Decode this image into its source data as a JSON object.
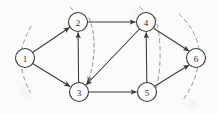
{
  "figure": {
    "background_color": "#fcfbf9",
    "node_stroke_color": "#3a3a3a",
    "edge_color": "#3a3a3a",
    "cut_color": "#9a9a96",
    "width": 218,
    "height": 114
  },
  "nodes": [
    {
      "id": "1",
      "label": "1",
      "cx": 25,
      "cy": 58,
      "r": 9.5
    },
    {
      "id": "2",
      "label": "2",
      "cx": 78,
      "cy": 22,
      "r": 9.5
    },
    {
      "id": "3",
      "label": "3",
      "cx": 79,
      "cy": 92,
      "r": 9.5
    },
    {
      "id": "4",
      "label": "4",
      "cx": 146,
      "cy": 22,
      "r": 9.5
    },
    {
      "id": "5",
      "label": "5",
      "cx": 147,
      "cy": 92,
      "r": 9.5
    },
    {
      "id": "6",
      "label": "6",
      "cx": 196,
      "cy": 58,
      "r": 9.5
    }
  ],
  "edges": [
    {
      "id": "e1-2",
      "from": "1",
      "to": "2",
      "label": ""
    },
    {
      "id": "e1-3",
      "from": "1",
      "to": "3",
      "label": ""
    },
    {
      "id": "e2-4",
      "from": "2",
      "to": "4",
      "label": ""
    },
    {
      "id": "e3-2",
      "from": "3",
      "to": "2",
      "label": ""
    },
    {
      "id": "e4-3",
      "from": "4",
      "to": "3",
      "label": ""
    },
    {
      "id": "e3-5",
      "from": "3",
      "to": "5",
      "label": ""
    },
    {
      "id": "e5-4",
      "from": "5",
      "to": "4",
      "label": ""
    },
    {
      "id": "e4-6",
      "from": "4",
      "to": "6",
      "label": ""
    },
    {
      "id": "e5-6",
      "from": "5",
      "to": "6",
      "label": ""
    }
  ],
  "cut_curves": [
    {
      "id": "cut-left",
      "name": "cut-through-node-1"
    },
    {
      "id": "cut-middle",
      "name": "cut-between-2-and-3"
    },
    {
      "id": "cut-center",
      "name": "cut-between-4-and-5"
    },
    {
      "id": "cut-right",
      "name": "cut-around-node-6"
    }
  ]
}
